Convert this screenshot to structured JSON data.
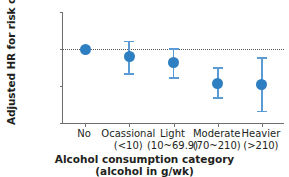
{
  "chart_data": {
    "type": "scatter",
    "title": "",
    "xlabel": "Alcohol consumption category",
    "xlabel_sub": "(alcohol in g/wk)",
    "ylabel": "Adjusted HR for risk of CKD",
    "yscale": "log",
    "ylim": [
      0.25,
      2.0
    ],
    "yticks": [
      "0.25",
      "0.50",
      "1.00",
      "2.00"
    ],
    "ytick_values": [
      0.25,
      0.5,
      1.0,
      2.0
    ],
    "grid": false,
    "legend": false,
    "reference_line": {
      "value": 1.0,
      "style": "dotted",
      "color": "#58595b"
    },
    "marker_color": "#2e7fc2",
    "errorbar_color": "#5b9bd5",
    "categories": [
      {
        "name": "No",
        "range": ""
      },
      {
        "name": "Ocassional",
        "range": "(<10)"
      },
      {
        "name": "Light",
        "range": "(10~69.9)"
      },
      {
        "name": "Moderate",
        "range": "(70~210)"
      },
      {
        "name": "Heavier",
        "range": "(>210)"
      }
    ],
    "values": [
      1.0,
      0.87,
      0.77,
      0.52,
      0.51
    ],
    "ci_low": [
      null,
      0.63,
      0.58,
      0.4,
      0.31
    ],
    "ci_high": [
      null,
      1.15,
      1.0,
      0.7,
      0.85
    ]
  }
}
